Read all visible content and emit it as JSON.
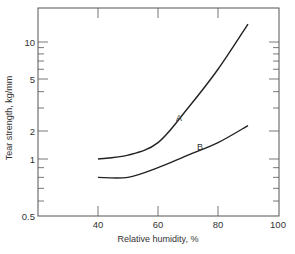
{
  "chart_data": {
    "type": "line",
    "title": "",
    "xlabel": "Relative humidity, %",
    "ylabel": "Tear strength, kg/mm",
    "xlim": [
      30,
      100
    ],
    "ylim": [
      0.5,
      15
    ],
    "yscale": "log",
    "grid": false,
    "x_ticks": [
      40,
      60,
      80,
      100
    ],
    "y_ticks": [
      0.5,
      1,
      2,
      5,
      10
    ],
    "x_tick_labels": [
      "40",
      "60",
      "80",
      "100"
    ],
    "y_tick_labels": [
      "0.5",
      "1",
      "2",
      "5",
      "10"
    ],
    "x": [
      40,
      50,
      60,
      70,
      80,
      90
    ],
    "series": [
      {
        "name": "A",
        "values": [
          1.0,
          1.1,
          1.5,
          3.0,
          6.0,
          14.0
        ]
      },
      {
        "name": "B",
        "values": [
          0.8,
          0.8,
          0.9,
          1.1,
          1.5,
          2.2
        ]
      }
    ],
    "annotations": [
      {
        "text": "A",
        "x": 67,
        "y": 2.4
      },
      {
        "text": "B",
        "x": 74,
        "y": 1.25
      }
    ],
    "legend": null
  },
  "colors": {
    "line": "#222222",
    "axis": "#555555",
    "text": "#333333"
  }
}
